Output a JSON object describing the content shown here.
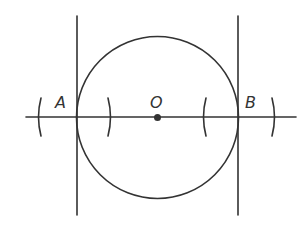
{
  "diagram": {
    "labels": {
      "A": "A",
      "O": "O",
      "B": "B"
    },
    "colors": {
      "stroke": "#333333",
      "background": "#ffffff"
    },
    "geometry": {
      "circle": {
        "cx": 157,
        "cy": 117,
        "r": 82
      },
      "horizontal_line": {
        "x1": 26,
        "y1": 117,
        "x2": 296,
        "y2": 117
      },
      "left_vertical": {
        "x": 77,
        "y1": 16,
        "y2": 215
      },
      "right_vertical": {
        "x": 238,
        "y1": 16,
        "y2": 215
      },
      "center_point": {
        "x": 157,
        "y": 117
      },
      "arcs": [
        {
          "name": "arc-far-left",
          "x": 40,
          "dir": "left"
        },
        {
          "name": "arc-inner-left",
          "x": 110,
          "dir": "right"
        },
        {
          "name": "arc-inner-right",
          "x": 204,
          "dir": "left"
        },
        {
          "name": "arc-far-right",
          "x": 273,
          "dir": "right"
        }
      ]
    }
  }
}
